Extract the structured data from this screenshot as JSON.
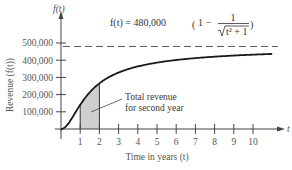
{
  "chart_data": {
    "type": "line",
    "title": "",
    "formula": {
      "lhs": "f(t) = 480,000",
      "numerator": "1",
      "denominator": "t² + 1",
      "display": "f(t) = 480,000 (1 − 1/√(t² + 1))"
    },
    "xlabel": "Time in years (t)",
    "ylabel": "Revenue (f(t))",
    "x_axis_symbol": "t",
    "y_axis_symbol": "f(t)",
    "xlim": [
      0,
      11
    ],
    "ylim": [
      0,
      500000
    ],
    "x_ticks": [
      "1",
      "2",
      "3",
      "4",
      "5",
      "6",
      "7",
      "8",
      "9",
      "10"
    ],
    "y_ticks": [
      "100,000",
      "200,000",
      "300,000",
      "400,000",
      "500,000"
    ],
    "asymptote": {
      "y": 480000,
      "style": "dashed"
    },
    "series": [
      {
        "name": "f(t)",
        "x": [
          0,
          0.25,
          0.5,
          0.75,
          1,
          1.5,
          2,
          3,
          4,
          5,
          6,
          7,
          8,
          9,
          10,
          11
        ],
        "values": [
          0,
          14400,
          50700,
          96000,
          140600,
          213700,
          265300,
          328200,
          363600,
          385900,
          401100,
          412100,
          420400,
          427000,
          432200,
          436300
        ]
      }
    ],
    "shaded_region": {
      "from": 1,
      "to": 2,
      "label": "Total revenue for second year"
    },
    "annotations": [
      "Total revenue",
      "for second year"
    ],
    "grid": false,
    "legend": "none"
  }
}
